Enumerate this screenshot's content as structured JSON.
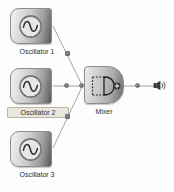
{
  "canvas": {
    "title": "Oscillator Mixer Patch",
    "width": 174,
    "height": 192,
    "background_color": "#fdfdfd",
    "wire_color": "#8b8b8b",
    "node_border_color": "#8d8d8d",
    "selection_color": "#e9e6de"
  },
  "nodes": [
    {
      "id": "osc1",
      "label": "Oscillator 1",
      "icon": "sine-wave-icon",
      "selected": false,
      "x": 10,
      "y": 8
    },
    {
      "id": "osc2",
      "label": "Oscillator 2",
      "icon": "sine-wave-icon",
      "selected": true,
      "x": 10,
      "y": 68
    },
    {
      "id": "osc3",
      "label": "Oscillator 3",
      "icon": "sine-wave-icon",
      "selected": false,
      "x": 10,
      "y": 131
    },
    {
      "id": "mixer",
      "label": "Mixer",
      "icon": "summing-mixer-icon",
      "selected": false,
      "x": 84,
      "y": 66
    }
  ],
  "output": {
    "label": "",
    "icon": "speaker-output-icon"
  },
  "ports": [
    {
      "name": "osc1-output-port",
      "x": 67,
      "y": 53
    },
    {
      "name": "osc2-output-port",
      "x": 67,
      "y": 84
    },
    {
      "name": "osc3-output-port",
      "x": 67,
      "y": 114
    },
    {
      "name": "mixer-input-port",
      "x": 80,
      "y": 84
    },
    {
      "name": "mixer-output-port",
      "x": 137,
      "y": 84
    }
  ],
  "connections": [
    {
      "name": "osc1-to-mixer",
      "from": "osc1",
      "to": "mixer"
    },
    {
      "name": "osc2-to-mixer",
      "from": "osc2",
      "to": "mixer"
    },
    {
      "name": "osc3-to-mixer",
      "from": "osc3",
      "to": "mixer"
    },
    {
      "name": "mixer-to-output",
      "from": "mixer",
      "to": "output"
    }
  ]
}
